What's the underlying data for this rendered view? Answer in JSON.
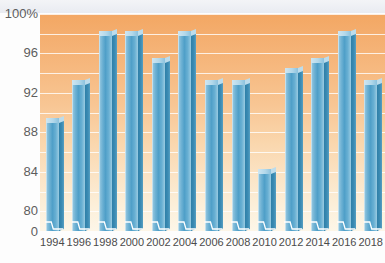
{
  "title": "",
  "axis": {
    "y_unit_suffix": "%",
    "y_ticks": [
      "100%",
      "96",
      "92",
      "88",
      "84",
      "80",
      "0"
    ],
    "y_tick_values": [
      100,
      96,
      92,
      88,
      84,
      80,
      0
    ],
    "broken_axis": true
  },
  "chart_data": {
    "type": "bar",
    "title": "",
    "xlabel": "",
    "ylabel": "",
    "ylim": [
      78,
      100
    ],
    "grid": true,
    "grid_interval": 2,
    "legend": "none",
    "broken_y_axis": true,
    "categories": [
      "1994",
      "1996",
      "1998",
      "2000",
      "2002",
      "2004",
      "2006",
      "2008",
      "2010",
      "2012",
      "2014",
      "2016",
      "2018"
    ],
    "values": [
      89.2,
      93.0,
      98.0,
      98.0,
      95.2,
      98.0,
      93.0,
      93.0,
      84.0,
      94.2,
      95.2,
      98.0,
      93.0
    ],
    "tick_labels_y": [
      "100%",
      "96",
      "92",
      "88",
      "84",
      "80",
      "0"
    ],
    "colors": {
      "bar_face": "#4f9fc8",
      "bar_highlight": "#a9d3e6",
      "bar_side": "#2e7fa8",
      "bar_top": "#b3d8ea",
      "plot_bg_top": "#f3a763",
      "plot_bg_bottom": "#fdf6e8",
      "gridline": "#ffffff",
      "axis_text": "#5d5d5d"
    }
  }
}
